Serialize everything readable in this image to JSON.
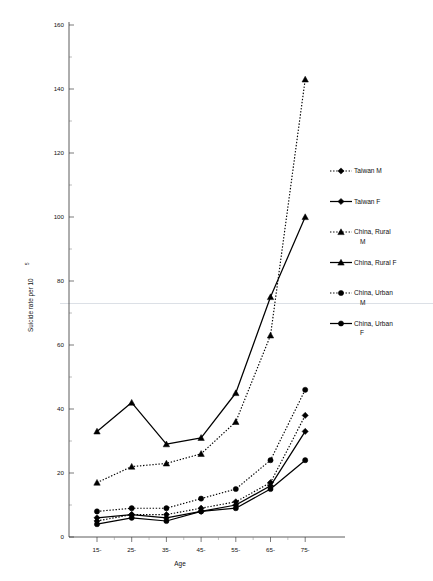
{
  "chart_data": {
    "type": "line",
    "title": "",
    "subtitle": "",
    "xlabel": "Age",
    "ylabel": "Suicide rate per 10",
    "ylabel_exponent": "5",
    "categories": [
      "15-",
      "25-",
      "35-",
      "45-",
      "55-",
      "65-",
      "75-"
    ],
    "xtick_labels": [
      "15-",
      "25-",
      "35-",
      "45-",
      "55-",
      "65-",
      "75-"
    ],
    "ytick_labels": [
      "0",
      "20",
      "40",
      "60",
      "80",
      "100",
      "120",
      "140",
      "160"
    ],
    "ytick_values": [
      0,
      20,
      40,
      60,
      80,
      100,
      120,
      140,
      160
    ],
    "ylim": [
      0,
      168
    ],
    "grid": false,
    "legend_position": "right",
    "series": [
      {
        "name": "Taiwan M",
        "label": "Taiwan M",
        "marker": "diamond",
        "linestyle": "dotted",
        "color": "#000000",
        "values": [
          5,
          7,
          7,
          9,
          11,
          17,
          38
        ]
      },
      {
        "name": "Taiwan F",
        "label": "Taiwan F",
        "marker": "diamond",
        "linestyle": "solid",
        "color": "#000000",
        "values": [
          6,
          7,
          6,
          8,
          10,
          16,
          33
        ]
      },
      {
        "name": "China, Rural M",
        "label": "China, Rural M",
        "marker": "triangle",
        "linestyle": "dotted",
        "color": "#000000",
        "values": [
          17,
          22,
          23,
          26,
          36,
          63,
          143
        ]
      },
      {
        "name": "China, Rural F",
        "label": "China, Rural F",
        "marker": "triangle",
        "linestyle": "solid",
        "color": "#000000",
        "values": [
          33,
          42,
          29,
          31,
          45,
          75,
          100
        ]
      },
      {
        "name": "China, Urban M",
        "label": "China, Urban M",
        "marker": "circle",
        "linestyle": "dotted",
        "color": "#000000",
        "values": [
          8,
          9,
          9,
          12,
          15,
          24,
          46
        ]
      },
      {
        "name": "China, Urban F",
        "label": "China, Urban F",
        "marker": "circle",
        "linestyle": "solid",
        "color": "#000000",
        "values": [
          4,
          6,
          5,
          8,
          9,
          15,
          24
        ]
      }
    ]
  },
  "legend": {
    "entries": [
      {
        "label_line1": "Taiwan M",
        "label_line2": ""
      },
      {
        "label_line1": "Taiwan F",
        "label_line2": ""
      },
      {
        "label_line1": "China, Rural",
        "label_line2": "M"
      },
      {
        "label_line1": "China, Rural F",
        "label_line2": ""
      },
      {
        "label_line1": "China, Urban",
        "label_line2": "M"
      },
      {
        "label_line1": "China, Urban",
        "label_line2": "F"
      }
    ]
  },
  "axes": {
    "x_title": "Age",
    "y_title_main": "Suicide rate per 10",
    "y_title_sup": "5"
  }
}
